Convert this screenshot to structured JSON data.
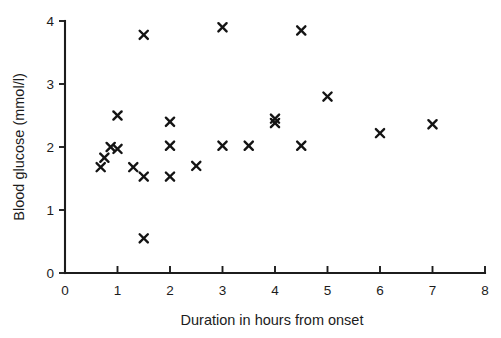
{
  "chart_data": {
    "type": "scatter",
    "title": "",
    "xlabel": "Duration in hours from onset",
    "ylabel": "Blood glucose (mmol/l)",
    "xlim": [
      0,
      8
    ],
    "ylim": [
      0,
      4
    ],
    "xticks": [
      0,
      1,
      2,
      3,
      4,
      5,
      6,
      7,
      8
    ],
    "yticks": [
      0,
      1,
      2,
      3,
      4
    ],
    "xtick_labels": [
      "0",
      "1",
      "2",
      "3",
      "4",
      "5",
      "6",
      "7",
      "8"
    ],
    "ytick_labels": [
      "0",
      "1",
      "2",
      "3",
      "4"
    ],
    "grid": false,
    "legend": null,
    "marker": "x",
    "marker_color": "#141414",
    "points": [
      {
        "x": 0.68,
        "y": 1.68
      },
      {
        "x": 0.75,
        "y": 1.83
      },
      {
        "x": 0.87,
        "y": 2.0
      },
      {
        "x": 1.0,
        "y": 1.97
      },
      {
        "x": 1.0,
        "y": 2.5
      },
      {
        "x": 1.3,
        "y": 1.68
      },
      {
        "x": 1.5,
        "y": 3.78
      },
      {
        "x": 1.5,
        "y": 1.53
      },
      {
        "x": 1.5,
        "y": 0.55
      },
      {
        "x": 2.0,
        "y": 2.4
      },
      {
        "x": 2.0,
        "y": 2.02
      },
      {
        "x": 2.0,
        "y": 1.53
      },
      {
        "x": 2.5,
        "y": 1.7
      },
      {
        "x": 3.0,
        "y": 3.9
      },
      {
        "x": 3.0,
        "y": 2.02
      },
      {
        "x": 3.5,
        "y": 2.02
      },
      {
        "x": 4.0,
        "y": 2.45
      },
      {
        "x": 4.0,
        "y": 2.38
      },
      {
        "x": 4.5,
        "y": 3.85
      },
      {
        "x": 4.5,
        "y": 2.02
      },
      {
        "x": 5.0,
        "y": 2.8
      },
      {
        "x": 6.0,
        "y": 2.22
      },
      {
        "x": 7.0,
        "y": 2.36
      }
    ]
  },
  "axes": {
    "x_title": "Duration in hours from onset",
    "y_title": "Blood glucose (mmol/l)"
  }
}
